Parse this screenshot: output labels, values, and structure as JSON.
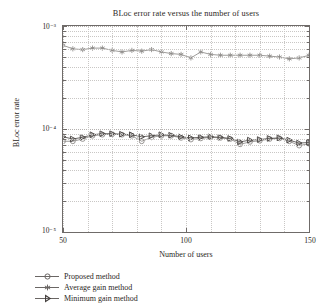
{
  "chart_data": {
    "type": "line",
    "title": "BLoc error rate versus the number of users",
    "xlabel": "Number of users",
    "ylabel": "BLoc error rate",
    "xlim": [
      50,
      150
    ],
    "ylim": [
      1e-05,
      0.001
    ],
    "yscale": "log",
    "grid": true,
    "legend_position": "below-left",
    "xticks": [
      50,
      100,
      150
    ],
    "xticklabels": [
      "50",
      "100",
      "150"
    ],
    "yticklabels": [
      "10⁻³",
      "10⁻⁴",
      "10⁻⁵"
    ],
    "x": [
      50,
      54,
      58,
      62,
      66,
      70,
      74,
      78,
      82,
      86,
      90,
      94,
      98,
      102,
      106,
      110,
      114,
      118,
      122,
      126,
      130,
      134,
      138,
      142,
      146,
      150
    ],
    "series": [
      {
        "name": "Proposed method",
        "marker": "circle-open",
        "color": "#8d8a88",
        "values": [
          7.6e-05,
          7.6e-05,
          8e-05,
          8.6e-05,
          8.8e-05,
          8.9e-05,
          8.8e-05,
          8.6e-05,
          7.6e-05,
          8.3e-05,
          8.6e-05,
          8.6e-05,
          8.2e-05,
          7.9e-05,
          8.1e-05,
          8.3e-05,
          8.2e-05,
          8e-05,
          7.1e-05,
          7.5e-05,
          7.7e-05,
          8e-05,
          8.1e-05,
          7.6e-05,
          6.9e-05,
          7.2e-05
        ]
      },
      {
        "name": "Average gain method",
        "marker": "asterisk",
        "color": "#8d8a88",
        "values": [
          0.00065,
          0.0006,
          0.00059,
          0.00061,
          0.00061,
          0.00058,
          0.00056,
          0.00058,
          0.00057,
          0.00059,
          0.00056,
          0.00054,
          0.00053,
          0.00049,
          0.00056,
          0.00053,
          0.00052,
          0.00052,
          0.00052,
          0.00052,
          0.00052,
          0.00051,
          0.0005,
          0.00048,
          0.00049,
          0.00052
        ]
      },
      {
        "name": "Minimum gain method",
        "marker": "triangle-right",
        "color": "#4f4b49",
        "values": [
          8.4e-05,
          8e-05,
          8.3e-05,
          8.8e-05,
          9e-05,
          9e-05,
          8.9e-05,
          8.8e-05,
          8.4e-05,
          8.6e-05,
          8.8e-05,
          8.7e-05,
          8.4e-05,
          8.2e-05,
          8.3e-05,
          8.4e-05,
          8.3e-05,
          8.1e-05,
          7.5e-05,
          7.8e-05,
          7.9e-05,
          8.1e-05,
          8.2e-05,
          7.8e-05,
          7.3e-05,
          7.4e-05
        ]
      }
    ]
  },
  "legend": {
    "items": [
      {
        "label": "Proposed method"
      },
      {
        "label": "Average gain method"
      },
      {
        "label": "Minimum gain method"
      }
    ]
  }
}
